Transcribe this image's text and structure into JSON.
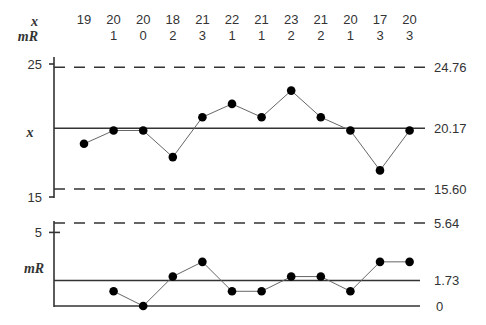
{
  "chart_data": [
    {
      "type": "line",
      "title": "Individuals (x) control chart",
      "ylabel": "x",
      "x": [
        1,
        2,
        3,
        4,
        5,
        6,
        7,
        8,
        9,
        10,
        11,
        12
      ],
      "values": [
        19,
        20,
        20,
        18,
        21,
        22,
        21,
        23,
        21,
        20,
        17,
        20
      ],
      "center_line": 20.17,
      "ucl": 24.76,
      "lcl": 15.6,
      "center_label": "20.17",
      "ucl_label": "24.76",
      "lcl_label": "15.60",
      "yticks": [
        "25",
        "15"
      ],
      "ytick_values": [
        25,
        15
      ],
      "ylim": [
        15,
        25
      ]
    },
    {
      "type": "line",
      "title": "Moving range (mR) control chart",
      "ylabel": "mR",
      "x": [
        2,
        3,
        4,
        5,
        6,
        7,
        8,
        9,
        10,
        11,
        12
      ],
      "values": [
        1,
        0,
        2,
        3,
        1,
        1,
        2,
        2,
        1,
        3,
        3
      ],
      "center_line": 1.73,
      "ucl": 5.64,
      "lcl": 0,
      "center_label": "1.73",
      "ucl_label": "5.64",
      "lcl_label": "0",
      "yticks": [
        "5"
      ],
      "ytick_values": [
        5
      ],
      "ylim": [
        0,
        5.64
      ]
    }
  ],
  "table": {
    "row_labels": [
      "x",
      "mR"
    ],
    "x_values": [
      "19",
      "20",
      "20",
      "18",
      "21",
      "22",
      "21",
      "23",
      "21",
      "20",
      "17",
      "20"
    ],
    "mr_values": [
      "",
      "1",
      "0",
      "2",
      "3",
      "1",
      "1",
      "2",
      "2",
      "1",
      "3",
      "3"
    ]
  },
  "colors": {
    "line": "#333333",
    "point": "#000000",
    "connector": "#666666"
  }
}
